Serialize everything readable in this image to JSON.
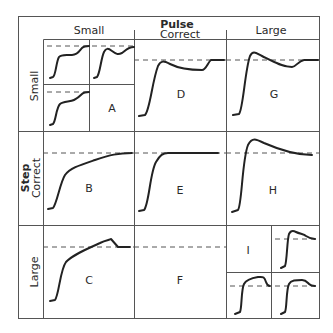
{
  "header": {
    "axis_title": "Pulse",
    "columns": [
      "Small",
      "Correct",
      "Large"
    ]
  },
  "side": {
    "axis_title": "Step",
    "rows": [
      "Small",
      "Correct",
      "Large"
    ]
  },
  "cells": {
    "A": "A",
    "B": "B",
    "C": "C",
    "D": "D",
    "E": "E",
    "F": "F",
    "G": "G",
    "H": "H",
    "I": "I"
  },
  "colors": {
    "line": "#222222",
    "grid": "#555555",
    "dashed": "#555555"
  }
}
